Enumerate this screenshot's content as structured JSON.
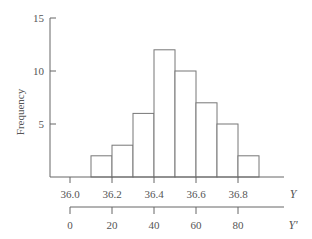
{
  "chart_data": {
    "type": "bar",
    "subtype": "histogram",
    "title": "",
    "xlabel": "Y",
    "x2label": "Y'",
    "ylabel": "Frequency",
    "ylim": [
      0,
      15
    ],
    "yticks": [
      "5",
      "10",
      "15"
    ],
    "xticks": [
      "36.0",
      "36.2",
      "36.4",
      "36.6",
      "36.8"
    ],
    "x2ticks": [
      "0",
      "20",
      "40",
      "60",
      "80"
    ],
    "bin_edges": [
      36.05,
      36.15,
      36.25,
      36.35,
      36.45,
      36.55,
      36.65,
      36.75,
      36.85
    ],
    "categories": [
      "36.1",
      "36.2",
      "36.3",
      "36.4",
      "36.5",
      "36.6",
      "36.7",
      "36.8"
    ],
    "values": [
      2,
      3,
      6,
      12,
      10,
      7,
      5,
      2
    ],
    "grid": false,
    "legend": null
  }
}
